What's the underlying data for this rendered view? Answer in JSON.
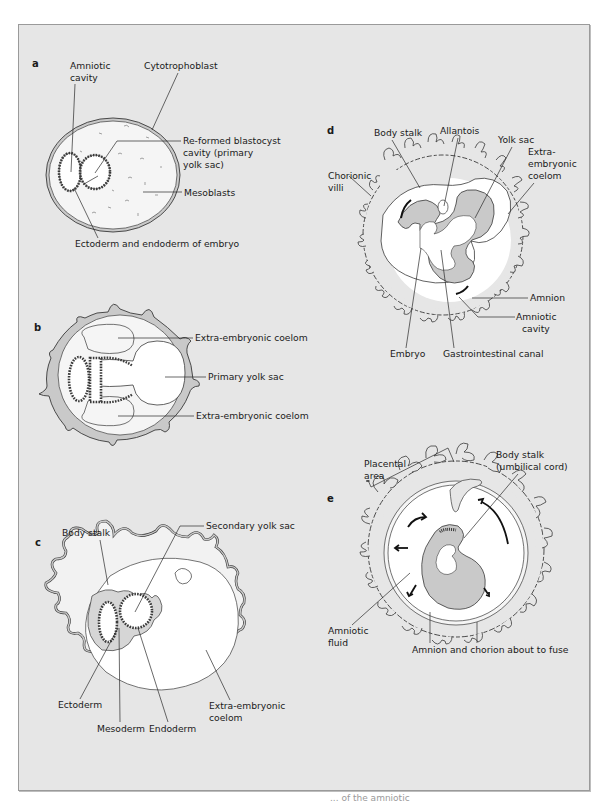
{
  "figure": {
    "panels": [
      {
        "id": "a",
        "letter": "a",
        "labels": {
          "amniotic_cavity_1": "Amniotic",
          "amniotic_cavity_2": "cavity",
          "cytotrophoblast": "Cytotrophoblast",
          "reformed_1": "Re-formed blastocyst",
          "reformed_2": "cavity (primary",
          "reformed_3": "yolk sac)",
          "mesoblasts": "Mesoblasts",
          "ectoderm_endoderm": "Ectoderm and endoderm of embryo"
        }
      },
      {
        "id": "b",
        "letter": "b",
        "labels": {
          "coelom_top": "Extra-embryonic coelom",
          "primary_yolk_sac": "Primary yolk sac",
          "coelom_bottom": "Extra-embryonic coelom"
        }
      },
      {
        "id": "c",
        "letter": "c",
        "labels": {
          "body_stalk": "Body stalk",
          "secondary_yolk_sac": "Secondary yolk sac",
          "ectoderm": "Ectoderm",
          "mesoderm": "Mesoderm",
          "endoderm": "Endoderm",
          "coelom_1": "Extra-embryonic",
          "coelom_2": "coelom"
        }
      },
      {
        "id": "d",
        "letter": "d",
        "labels": {
          "body_stalk": "Body stalk",
          "allantois": "Allantois",
          "yolk_sac": "Yolk sac",
          "coelom_1": "Extra-",
          "coelom_2": "embryonic",
          "coelom_3": "coelom",
          "chorionic_1": "Chorionic",
          "chorionic_2": "villi",
          "amnion": "Amnion",
          "amniotic_cavity_1": "Amniotic",
          "amniotic_cavity_2": "cavity",
          "embryo": "Embryo",
          "gi_canal": "Gastrointestinal canal"
        }
      },
      {
        "id": "e",
        "letter": "e",
        "labels": {
          "placental_1": "Placental",
          "placental_2": "area",
          "body_stalk_1": "Body stalk",
          "body_stalk_2": "(umbilical cord)",
          "amniotic_fluid_1": "Amniotic",
          "amniotic_fluid_2": "fluid",
          "amnion_chorion": "Amnion and chorion about to fuse"
        }
      }
    ],
    "colors": {
      "panel_bg": "#e6e6e6",
      "tissue": "#c9c9c9",
      "membrane": "#f2f2f2",
      "cavity": "#ffffff",
      "outline": "#3a3a3a"
    },
    "caption_fragment": "... of the amniotic"
  }
}
